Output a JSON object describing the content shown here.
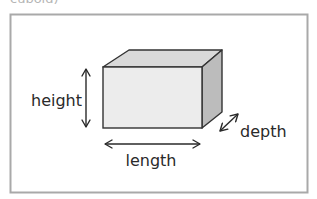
{
  "header": {
    "cut_off_text": "cuboid)"
  },
  "diagram": {
    "labels": {
      "height": "height",
      "length": "length",
      "depth": "depth"
    },
    "colors": {
      "frame_border": "#a9a9a9",
      "front_face": "#ececec",
      "top_face": "#d9d9d9",
      "side_face": "#bcbcbc",
      "edges": "#333333",
      "arrows": "#2a2a2a",
      "text": "#2a2a2a"
    }
  }
}
